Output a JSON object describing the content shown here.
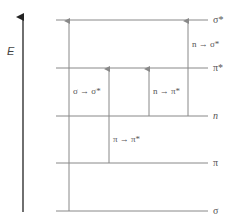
{
  "diagram": {
    "axis": {
      "label": "E",
      "direction": "up"
    },
    "levels": [
      {
        "id": "sigma_star",
        "label": "σ*",
        "y": 20
      },
      {
        "id": "pi_star",
        "label": "π*",
        "y": 68
      },
      {
        "id": "n",
        "label": "n",
        "y": 116
      },
      {
        "id": "pi",
        "label": "π",
        "y": 163
      },
      {
        "id": "sigma",
        "label": "σ",
        "y": 211
      }
    ],
    "transitions": [
      {
        "label": "σ → σ*",
        "from": "σ",
        "to": "σ*",
        "x": 69
      },
      {
        "label": "π → π*",
        "from": "π",
        "to": "π*",
        "x": 109
      },
      {
        "label": "n → π*",
        "from": "n",
        "to": "π*",
        "x": 149
      },
      {
        "label": "n → σ*",
        "from": "n",
        "to": "σ*",
        "x": 188
      }
    ],
    "colors": {
      "line": "#888888",
      "axis": "#333333",
      "text": "#555555"
    }
  }
}
